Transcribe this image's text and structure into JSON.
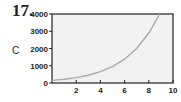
{
  "problem_number": "17.",
  "chart_data": {
    "type": "line",
    "title": "",
    "xlabel": "",
    "ylabel": "C",
    "xlim": [
      0,
      10
    ],
    "ylim": [
      0,
      4000
    ],
    "x_ticks": [
      2,
      4,
      6,
      8,
      10
    ],
    "y_ticks": [
      0,
      1000,
      2000,
      3000,
      4000
    ],
    "grid": false,
    "series": [
      {
        "name": "C",
        "x": [
          0,
          1,
          2,
          3,
          4,
          5,
          6,
          7,
          8,
          8.9
        ],
        "y": [
          150,
          217,
          314,
          455,
          660,
          950,
          1380,
          2000,
          2900,
          4000
        ]
      }
    ],
    "colors": {
      "curve": "#a9a9a9",
      "plot_bg": "#f2f2f2",
      "axis": "#222222"
    }
  }
}
